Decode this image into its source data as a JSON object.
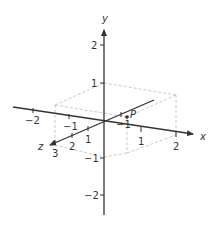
{
  "diagram": {
    "type": "3d-coordinate-axes",
    "axes": {
      "x": {
        "name": "x",
        "ticks": [
          "−2",
          "−1",
          "1",
          "2"
        ]
      },
      "y": {
        "name": "y",
        "ticks": [
          "2",
          "1",
          "−1",
          "−2"
        ]
      },
      "z": {
        "name": "z",
        "ticks": [
          "1",
          "2",
          "3"
        ]
      }
    },
    "point": {
      "label": "P",
      "z_tick_near_label": "−1"
    },
    "x_neg1_label": "−1",
    "colors": {
      "axis": "#333333",
      "dash": "#bbbbbb",
      "text": "#333333"
    }
  }
}
